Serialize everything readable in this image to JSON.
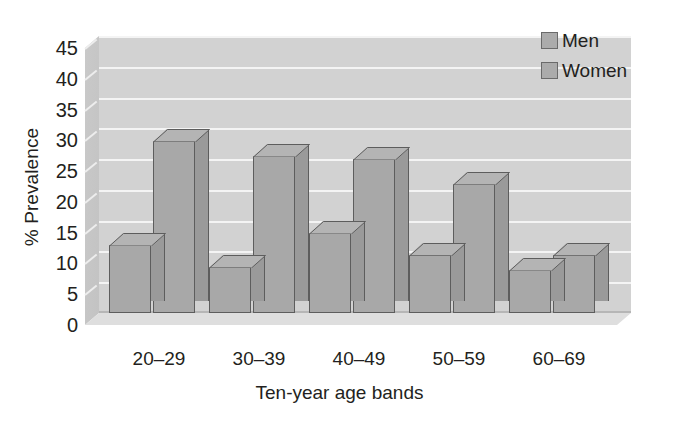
{
  "chart_data": {
    "type": "bar",
    "title": "",
    "xlabel": "Ten-year age bands",
    "ylabel": "% Prevalence",
    "categories": [
      "20–29",
      "30–39",
      "40–49",
      "50–59",
      "60–69"
    ],
    "series": [
      {
        "name": "Men",
        "values": [
          11,
          7.5,
          13,
          9.5,
          7
        ]
      },
      {
        "name": "Women",
        "values": [
          28,
          25.5,
          25,
          21,
          9.5
        ]
      }
    ],
    "ylim": [
      0,
      45
    ],
    "yticks": [
      0,
      5,
      10,
      15,
      20,
      25,
      30,
      35,
      40,
      45
    ],
    "ytick_labels": [
      "0",
      "5",
      "10",
      "15",
      "20",
      "25",
      "30",
      "35",
      "40",
      "45"
    ],
    "grid": true,
    "legend_position": "top-right",
    "style": "3d-column",
    "colors": {
      "bar_face": "#a8a8a8",
      "bar_side": "#9a9a9a",
      "bar_top": "#b4b4b4",
      "bar_edge": "#5d5d5d",
      "plot_background": "#d2d2d2",
      "gridline": "#f4f4f4",
      "floor": "#dedede",
      "text": "#231f20"
    }
  },
  "legend": {
    "items": [
      {
        "label": "Men"
      },
      {
        "label": "Women"
      }
    ]
  }
}
